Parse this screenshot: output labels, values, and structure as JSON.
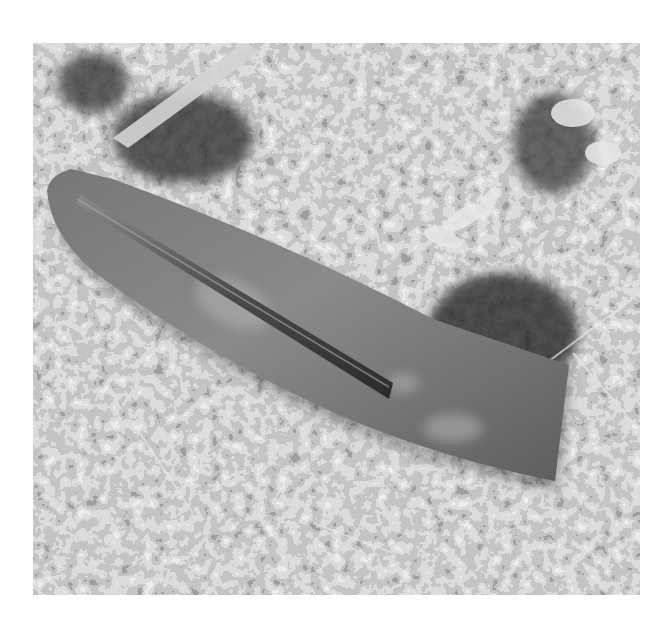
{
  "image": {
    "description": "Grayscale photograph of a curved, flat rusted metal blade-like object with a raised bar along its upper edge, lying on forest-floor leaf litter",
    "subject": "curved metal blade on leaf litter",
    "palette": {
      "paper": "#ffffff",
      "litter_light": "#d8d8d8",
      "litter_mid": "#8c8c8c",
      "litter_dark": "#3a3a3a",
      "blade": "#6e6e6e",
      "blade_highlight": "#9a9a9a",
      "bar": "#3c3c3c"
    }
  },
  "caption": {
    "text": ""
  }
}
